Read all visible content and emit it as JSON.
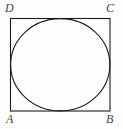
{
  "figure": {
    "type": "geometry-diagram",
    "background_color": "#fefefe",
    "stroke_color": "#1a1a1a",
    "label_color": "#444444",
    "stroke_width": 1,
    "canvas": {
      "width": 123,
      "height": 129
    },
    "square": {
      "name": "square-ABCD",
      "left": 10,
      "top": 18,
      "right": 110,
      "bottom": 111,
      "width": 100,
      "height": 93
    },
    "circle": {
      "name": "inscribed-circle",
      "cx": 60,
      "cy": 64.5,
      "rx": 50,
      "ry": 46.5
    },
    "labels": [
      {
        "id": "D",
        "text": "D",
        "corner": "top-left"
      },
      {
        "id": "C",
        "text": "C",
        "corner": "top-right"
      },
      {
        "id": "A",
        "text": "A",
        "corner": "bottom-left"
      },
      {
        "id": "B",
        "text": "B",
        "corner": "bottom-right"
      }
    ]
  }
}
